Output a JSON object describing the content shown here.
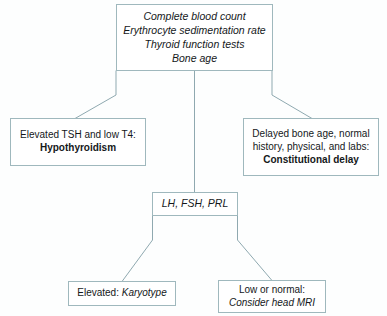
{
  "diagram": {
    "colors": {
      "border": "#9fb8bd",
      "connector": "#8fa9b0",
      "background": "#fdfefe",
      "text": "#14181a"
    },
    "nodes": [
      {
        "id": "labs",
        "name": "initial-laboratory-tests",
        "lines": [
          {
            "text": "Complete blood count",
            "style": "italic"
          },
          {
            "text": "Erythrocyte sedimentation rate",
            "style": "italic"
          },
          {
            "text": "Thyroid function tests",
            "style": "italic"
          },
          {
            "text": "Bone age",
            "style": "italic"
          }
        ]
      },
      {
        "id": "hypothyroidism",
        "name": "hypothyroidism-outcome",
        "lines": [
          {
            "text": "Elevated TSH and low T4:",
            "style": "regular"
          },
          {
            "text": "Hypothyroidism",
            "style": "bold"
          }
        ]
      },
      {
        "id": "constitutional",
        "name": "constitutional-delay-outcome",
        "lines": [
          {
            "text": "Delayed bone age, normal",
            "style": "regular"
          },
          {
            "text": "history, physical, and labs:",
            "style": "regular"
          },
          {
            "text": "Constitutional delay",
            "style": "bold"
          }
        ]
      },
      {
        "id": "hormones",
        "name": "gonadotropin-panel",
        "lines": [
          {
            "text": "LH, FSH, PRL",
            "style": "italic"
          }
        ]
      },
      {
        "id": "karyotype",
        "name": "karyotype-outcome",
        "lines": [
          {
            "text": "Elevated: ",
            "style": "regular"
          },
          {
            "text": "Karyotype",
            "style": "italic"
          }
        ]
      },
      {
        "id": "mri",
        "name": "head-mri-outcome",
        "lines": [
          {
            "text": "Low or normal:",
            "style": "regular"
          },
          {
            "text": "Consider head MRI",
            "style": "italic"
          }
        ]
      }
    ],
    "connectors": [
      {
        "name": "labs-to-hypothyroidism",
        "points": "116,71 116,95 75,118"
      },
      {
        "name": "labs-to-hormones",
        "points": "194,71 194,192"
      },
      {
        "name": "labs-to-constitutional",
        "points": "272,71 272,95 312,118"
      },
      {
        "name": "hormones-to-karyotype",
        "points": "152,216 152,240 122,281"
      },
      {
        "name": "hormones-to-mri",
        "points": "238,216 238,240 272,280"
      }
    ]
  }
}
